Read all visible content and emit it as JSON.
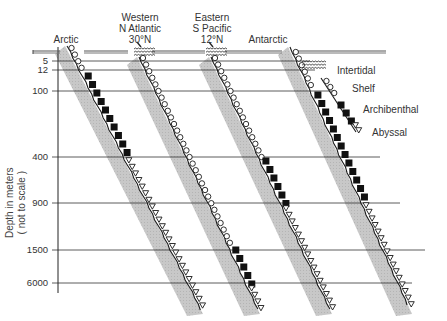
{
  "figure": {
    "title": "",
    "y_axis_label_line1": "Depth  in  meters",
    "y_axis_label_line2": "( not  to  scale )",
    "depth_ticks": [
      {
        "label": "5",
        "y": 61
      },
      {
        "label": "12",
        "y": 70
      },
      {
        "label": "100",
        "y": 91
      },
      {
        "label": "400",
        "y": 157
      },
      {
        "label": "900",
        "y": 203
      },
      {
        "label": "1500",
        "y": 250
      },
      {
        "label": "6000",
        "y": 283
      }
    ],
    "regions": [
      {
        "name": "Arctic",
        "label_lines": [
          "Arctic"
        ],
        "label_x": 66,
        "zones": [
          {
            "zone": "Shelf",
            "from": "surface",
            "to": "12"
          },
          {
            "zone": "Archibenthal",
            "from": "12",
            "to": "400"
          },
          {
            "zone": "Abyssal",
            "from": "400",
            "to": "bottom"
          }
        ]
      },
      {
        "name": "Western N Atlantic 30°N",
        "label_lines": [
          "Western",
          "N Atlantic",
          "30°N"
        ],
        "label_x": 140,
        "zones": [
          {
            "zone": "Intertidal",
            "from": "surface",
            "to": "5"
          },
          {
            "zone": "Shelf",
            "from": "5",
            "to": "1500"
          },
          {
            "zone": "Archibenthal",
            "from": "1500",
            "to": "6000"
          },
          {
            "zone": "Abyssal",
            "from": "6000",
            "to": "bottom"
          }
        ]
      },
      {
        "name": "Eastern S Pacific 12°N",
        "label_lines": [
          "Eastern",
          "S Pacific",
          "12°N"
        ],
        "label_x": 212,
        "zones": [
          {
            "zone": "Intertidal",
            "from": "surface",
            "to": "5"
          },
          {
            "zone": "Shelf",
            "from": "5",
            "to": "400"
          },
          {
            "zone": "Archibenthal",
            "from": "400",
            "to": "900"
          },
          {
            "zone": "Abyssal",
            "from": "900",
            "to": "bottom"
          }
        ]
      },
      {
        "name": "Antarctic",
        "label_lines": [
          "Antarctic"
        ],
        "label_x": 268,
        "zones": [
          {
            "zone": "Shelf",
            "from": "surface",
            "to": "100"
          },
          {
            "zone": "Archibenthal",
            "from": "100",
            "to": "900"
          },
          {
            "zone": "Abyssal",
            "from": "900",
            "to": "bottom"
          }
        ]
      }
    ],
    "legend": [
      {
        "zone": "Intertidal",
        "symbol": "wavy-lines"
      },
      {
        "zone": "Shelf",
        "symbol": "open-circle"
      },
      {
        "zone": "Archibenthal",
        "symbol": "filled-square"
      },
      {
        "zone": "Abyssal",
        "symbol": "open-triangle"
      }
    ],
    "colors": {
      "line": "#1a1a1a",
      "shading": "#c4c4c4",
      "text": "#333333"
    }
  }
}
